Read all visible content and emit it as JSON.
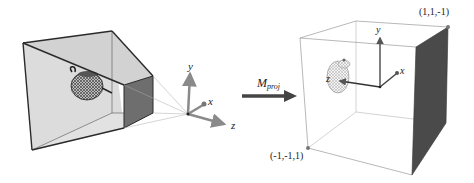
{
  "figure": {
    "left_panel": {
      "description": "view-frustum",
      "object": "teapot",
      "axes": {
        "y": "y",
        "x": "x",
        "z": "z"
      }
    },
    "transform": {
      "label_main": "M",
      "label_sub": "proj"
    },
    "right_panel": {
      "description": "canonical-view-volume",
      "object": "teapot",
      "axes": {
        "y": "y",
        "x": "x",
        "z": "z"
      },
      "corner_max": "(1,1,-1)",
      "corner_min": "(-1,-1,1)"
    },
    "colors": {
      "frustum_fill": "#d9d9d9",
      "near_plane_fill": "#6e6e6e",
      "edge": "#2a2a2a",
      "axis": "#8a8a8a",
      "arrow": "#444444",
      "cube_dark_face": "#4a4a4a"
    }
  }
}
